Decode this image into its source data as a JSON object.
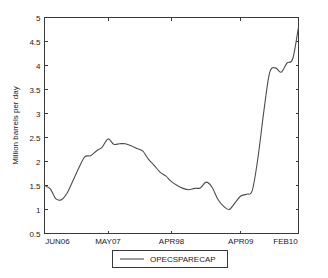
{
  "chart_data": {
    "type": "line",
    "title": "",
    "subtitle": "",
    "xlabel": "",
    "ylabel": "Million barrels per day",
    "ylim": [
      0.5,
      5
    ],
    "xlim": [
      0,
      44
    ],
    "grid": false,
    "legend_position": "bottom-outside",
    "y_ticks": [
      "0.5",
      "1",
      "1.5",
      "2",
      "2.5",
      "3",
      "3.5",
      "4",
      "4.5",
      "5"
    ],
    "y_tick_values": [
      0.5,
      1,
      1.5,
      2,
      2.5,
      3,
      3.5,
      4,
      4.5,
      5
    ],
    "x_ticks": [
      "JUN06",
      "MAY07",
      "APR98",
      "APR09",
      "FEB10"
    ],
    "x_tick_values": [
      0,
      11,
      22,
      34,
      44
    ],
    "series": [
      {
        "name": "OPECSPARECAP",
        "color": "#4d4d4d",
        "x": [
          0,
          1,
          2,
          3,
          4,
          5,
          6,
          7,
          8,
          9,
          10,
          11,
          12,
          13,
          14,
          15,
          16,
          17,
          18,
          19,
          20,
          21,
          22,
          23,
          24,
          25,
          26,
          27,
          28,
          29,
          30,
          31,
          32,
          33,
          34,
          35,
          36,
          37,
          38,
          39,
          40,
          41,
          42,
          43,
          44
        ],
        "values": [
          1.5,
          1.43,
          1.22,
          1.21,
          1.36,
          1.62,
          1.88,
          2.1,
          2.12,
          2.22,
          2.3,
          2.47,
          2.36,
          2.37,
          2.37,
          2.33,
          2.27,
          2.22,
          2.05,
          1.92,
          1.78,
          1.7,
          1.58,
          1.5,
          1.44,
          1.41,
          1.44,
          1.45,
          1.57,
          1.47,
          1.22,
          1.07,
          1.0,
          1.14,
          1.28,
          1.32,
          1.4,
          2.1,
          3.05,
          3.85,
          3.95,
          3.86,
          4.05,
          4.14,
          4.8
        ]
      }
    ],
    "legend": [
      {
        "label": "OPECSPARECAP",
        "color": "#4d4d4d"
      }
    ]
  },
  "figure": {
    "background": "#ffffff",
    "axis_color": "#3a3a3a",
    "text_color": "#1a1a1a"
  }
}
